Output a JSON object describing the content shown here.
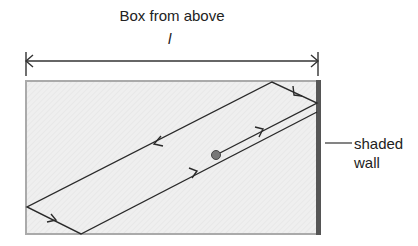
{
  "title": "Box from above",
  "dimension": {
    "label": "l",
    "x_start": 26,
    "x_end": 318,
    "y": 61
  },
  "box": {
    "x": 26,
    "y": 81,
    "width": 291,
    "height": 153,
    "fill": "#eeeeee",
    "border": "#aaaaaa"
  },
  "wall": {
    "label_line1": "shaded",
    "label_line2": "wall",
    "color": "#555555"
  },
  "ball": {
    "x": 216,
    "y": 155,
    "r": 4.5,
    "color": "#777777"
  },
  "path_points": [
    {
      "x": 216,
      "y": 155
    },
    {
      "x": 317,
      "y": 103
    },
    {
      "x": 272,
      "y": 82
    },
    {
      "x": 27,
      "y": 207
    },
    {
      "x": 81,
      "y": 234
    },
    {
      "x": 317,
      "y": 112
    }
  ]
}
